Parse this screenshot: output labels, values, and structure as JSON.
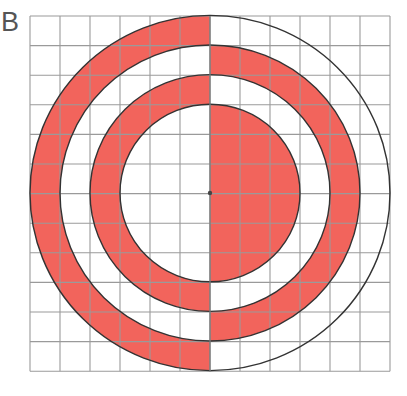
{
  "figure": {
    "label": "B",
    "grid": {
      "cols": 12,
      "rows": 12,
      "left": 30,
      "top": 16,
      "cell_w": 30,
      "cell_h": 29.6,
      "line_color": "#9a9a9a"
    },
    "center": {
      "x": 210,
      "y": 193
    },
    "fill_color": "#f2645c",
    "stroke_color": "#333333",
    "circles_radius_cells": [
      3,
      4,
      5,
      6
    ],
    "regions": [
      {
        "name": "inner-disk",
        "r_inner": 0,
        "r_outer": 3,
        "filled_half": "right"
      },
      {
        "name": "ring-3-4",
        "r_inner": 3,
        "r_outer": 4,
        "filled_half": "left"
      },
      {
        "name": "ring-4-5",
        "r_inner": 4,
        "r_outer": 5,
        "filled_half": "right"
      },
      {
        "name": "ring-5-6",
        "r_inner": 5,
        "r_outer": 6,
        "filled_half": "left"
      }
    ]
  }
}
